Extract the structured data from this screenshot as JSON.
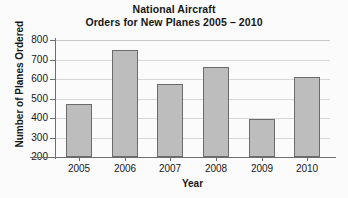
{
  "chart_data": {
    "type": "bar",
    "title": "National Aircraft Orders for New Planes 2005 – 2010",
    "title_lines": [
      "National Aircraft",
      "Orders for New Planes 2005 – 2010"
    ],
    "xlabel": "Year",
    "ylabel": "Number of Planes Ordered",
    "categories": [
      "2005",
      "2006",
      "2007",
      "2008",
      "2009",
      "2010"
    ],
    "values": [
      470,
      750,
      575,
      660,
      395,
      612
    ],
    "series": [
      {
        "name": "Number of Planes Ordered",
        "values": [
          470,
          750,
          575,
          660,
          395,
          612
        ]
      }
    ],
    "ylim": [
      200,
      800
    ],
    "yticks": [
      200,
      300,
      400,
      500,
      600,
      700,
      800
    ],
    "ytick_labels": [
      "200",
      "300",
      "400",
      "500",
      "600",
      "700",
      "800"
    ],
    "grid": true,
    "grid_axis": "y",
    "legend": false,
    "legend_position": "none",
    "bar_color": "#bdbdbd",
    "bar_edge_color": "#6b6b6b",
    "axis_color": "#6e6e6e",
    "grid_color": "#d8d8d8",
    "background_color": "#fbfbfb",
    "text_color": "#171717"
  }
}
